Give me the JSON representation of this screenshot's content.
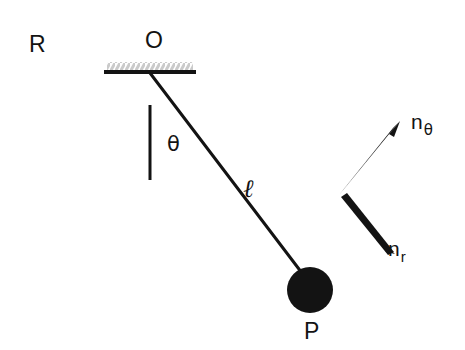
{
  "figure": {
    "kind": "physics-diagram",
    "background_color": "#ffffff",
    "ink_color": "#131313",
    "hatch_color": "#cfcfcf"
  },
  "labels": {
    "frame": "R",
    "pivot": "O",
    "angle": "θ",
    "rod_length": "ℓ",
    "bob": "P",
    "unit_vector_theta_base": "n",
    "unit_vector_theta_sub": "θ",
    "unit_vector_r_base": "n",
    "unit_vector_r_sub": "r"
  },
  "geometry": {
    "ceiling": {
      "x1": 104,
      "x2": 196,
      "y": 72,
      "thickness": 4,
      "hatch_height": 9
    },
    "pivot_point": {
      "x": 150,
      "y": 73
    },
    "vertical_reference": {
      "x": 150,
      "y1": 105,
      "y2": 180,
      "thickness": 3
    },
    "rod": {
      "x1": 150,
      "y1": 73,
      "x2": 304,
      "y2": 276,
      "thickness": 3
    },
    "bob": {
      "cx": 310,
      "cy": 290,
      "r": 23
    },
    "arrow_theta": {
      "x1": 341,
      "y1": 192,
      "x2": 397,
      "y2": 125,
      "thickness": 7
    },
    "arrow_r": {
      "x1": 343,
      "y1": 199,
      "x2": 392,
      "y2": 250,
      "thickness": 7
    },
    "angle_degrees": 37
  },
  "label_positions": {
    "frame": {
      "left": 29,
      "top": 33
    },
    "pivot": {
      "left": 145,
      "top": 29
    },
    "angle": {
      "left": 167,
      "top": 134
    },
    "rod_length": {
      "left": 243,
      "top": 176
    },
    "bob": {
      "left": 304,
      "top": 320
    },
    "unit_vector_theta": {
      "left": 411,
      "top": 110
    },
    "unit_vector_r": {
      "left": 388,
      "top": 237
    }
  }
}
